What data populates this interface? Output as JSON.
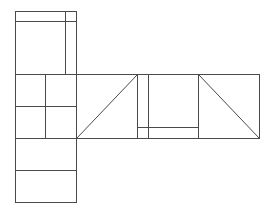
{
  "diagram": {
    "kind": "net-diagram",
    "faces": [
      {
        "id": "top",
        "subdivision": "horizontal line near top and vertical line near right"
      },
      {
        "id": "left-middle",
        "subdivision": "2x2 grid"
      },
      {
        "id": "bottom",
        "subdivision": "split into two horizontal halves"
      },
      {
        "id": "right-1",
        "subdivision": "diagonal from bottom-left to top-right"
      },
      {
        "id": "right-2",
        "subdivision": "vertical line near left and horizontal line near bottom"
      },
      {
        "id": "right-3",
        "subdivision": "diagonal from top-left to bottom-right"
      }
    ],
    "stroke_color": "#4a4a4a",
    "background_color": "#ffffff"
  }
}
